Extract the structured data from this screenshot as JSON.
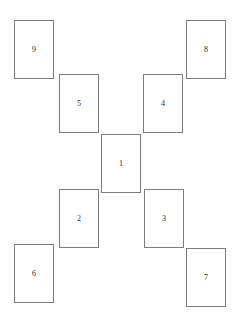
{
  "canvas": {
    "width": 240,
    "height": 320,
    "background_color": "#fefefe"
  },
  "style": {
    "card_border_color": "#7d7d7d",
    "card_fill_color": "#ffffff",
    "label_color": "#2b2b2b",
    "card_width": 40,
    "card_height": 59,
    "border_width": 1
  },
  "cards": [
    {
      "label": "9",
      "x": 14,
      "y": 20,
      "name": "card-9"
    },
    {
      "label": "8",
      "x": 186,
      "y": 20,
      "name": "card-8"
    },
    {
      "label": "5",
      "x": 59,
      "y": 74,
      "name": "card-5"
    },
    {
      "label": "4",
      "x": 143,
      "y": 74,
      "name": "card-4"
    },
    {
      "label": "1",
      "x": 101,
      "y": 134,
      "name": "card-1"
    },
    {
      "label": "2",
      "x": 59,
      "y": 189,
      "name": "card-2"
    },
    {
      "label": "3",
      "x": 144,
      "y": 189,
      "name": "card-3"
    },
    {
      "label": "6",
      "x": 14,
      "y": 244,
      "name": "card-6"
    },
    {
      "label": "7",
      "x": 186,
      "y": 248,
      "name": "card-7"
    }
  ]
}
